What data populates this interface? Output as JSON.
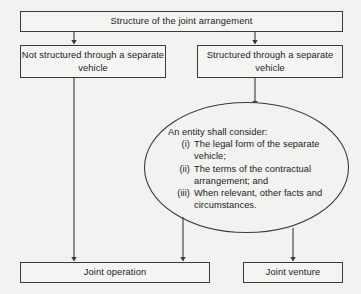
{
  "diagram": {
    "title_box": {
      "label": "Structure of the joint arrangement"
    },
    "branch_left": {
      "label": "Not structured through a separate vehicle"
    },
    "branch_right": {
      "label": "Structured through a separate vehicle"
    },
    "consideration": {
      "lead": "An entity shall consider:",
      "items": [
        {
          "marker": "(i)",
          "text": "The legal form of the separate vehicle;"
        },
        {
          "marker": "(ii)",
          "text": "The terms of the contractual arrangement; and"
        },
        {
          "marker": "(iii)",
          "text": "When relevant, other facts and circumstances."
        }
      ]
    },
    "outcome_left": {
      "label": "Joint operation"
    },
    "outcome_right": {
      "label": "Joint venture"
    },
    "colors": {
      "stroke": "#3a3a3a",
      "background": "#f2f2f0",
      "box_fill": "#f4f4f2",
      "text": "#1c1c1c"
    }
  }
}
